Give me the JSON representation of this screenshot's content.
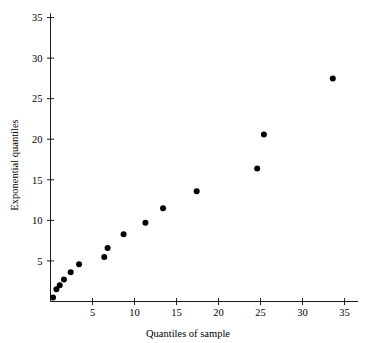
{
  "chart_data": {
    "type": "scatter",
    "title": "",
    "xlabel": "Quantiles of sample",
    "ylabel": "Exponential quantiles",
    "xlim": [
      0,
      36.6
    ],
    "ylim": [
      0,
      35.5
    ],
    "xticks": [
      5,
      10,
      15,
      20,
      25,
      30,
      35
    ],
    "xtick_labels": [
      "5",
      "10",
      "15",
      "20",
      "25",
      "30",
      "35"
    ],
    "yticks": [
      5,
      10,
      15,
      20,
      25,
      30,
      35
    ],
    "ytick_labels": [
      "5",
      "10",
      "15",
      "20",
      "25",
      "30",
      "35"
    ],
    "grid": false,
    "legend": null,
    "marker": "filled-circle",
    "marker_color": "#000000",
    "marker_size": 3,
    "points": [
      {
        "x": 0.3,
        "y": 0.5
      },
      {
        "x": 0.7,
        "y": 1.5
      },
      {
        "x": 1.1,
        "y": 2.0
      },
      {
        "x": 1.6,
        "y": 2.7
      },
      {
        "x": 2.4,
        "y": 3.6
      },
      {
        "x": 3.4,
        "y": 4.6
      },
      {
        "x": 6.4,
        "y": 5.5
      },
      {
        "x": 6.8,
        "y": 6.6
      },
      {
        "x": 8.7,
        "y": 8.3
      },
      {
        "x": 11.3,
        "y": 9.7
      },
      {
        "x": 13.4,
        "y": 11.5
      },
      {
        "x": 17.4,
        "y": 13.6
      },
      {
        "x": 24.6,
        "y": 16.4
      },
      {
        "x": 25.4,
        "y": 20.6
      },
      {
        "x": 33.6,
        "y": 27.5
      }
    ]
  }
}
